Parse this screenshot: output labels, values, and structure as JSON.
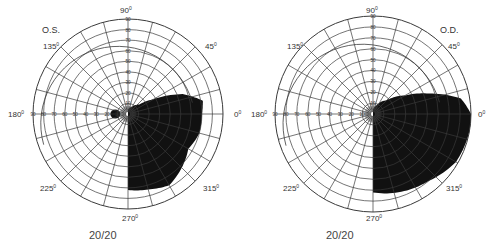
{
  "chart_data": [
    {
      "type": "polar-visual-field",
      "eye_label": "O.S.",
      "acuity": "20/20",
      "angle_labels": [
        "0°",
        "45°",
        "90°",
        "135°",
        "180°",
        "225°",
        "270°",
        "315°"
      ],
      "radial_ticks": [
        10,
        20,
        30,
        40,
        50,
        60,
        70,
        80,
        90
      ],
      "radial_unit": "degrees eccentricity",
      "meridian_step_deg": 15,
      "field_defect": {
        "description": "Dense inferior-nasal (lower right quadrant) field loss, upper boundary wavy, tapering toward 270°",
        "boundary_points_deg": [
          {
            "angle": 0,
            "ecc": 70
          },
          {
            "angle": 10,
            "ecc": 72
          },
          {
            "angle": 20,
            "ecc": 55
          },
          {
            "angle": 30,
            "ecc": 28
          },
          {
            "angle": 40,
            "ecc": 14
          },
          {
            "angle": 60,
            "ecc": 8
          },
          {
            "angle": 90,
            "ecc": 4
          },
          {
            "angle": 270,
            "ecc": 72
          },
          {
            "angle": 285,
            "ecc": 74
          },
          {
            "angle": 300,
            "ecc": 78
          },
          {
            "angle": 315,
            "ecc": 72
          },
          {
            "angle": 330,
            "ecc": 66
          },
          {
            "angle": 345,
            "ecc": 70
          }
        ],
        "small_scotoma": {
          "angle": 180,
          "ecc": 12
        }
      },
      "isopter_outer_deg": 60
    },
    {
      "type": "polar-visual-field",
      "eye_label": "O.D.",
      "acuity": "20/20",
      "angle_labels": [
        "0°",
        "45°",
        "90°",
        "135°",
        "180°",
        "225°",
        "270°",
        "315°"
      ],
      "radial_ticks": [
        10,
        20,
        30,
        40,
        50,
        60,
        70,
        80,
        90
      ],
      "radial_unit": "degrees eccentricity",
      "meridian_step_deg": 15,
      "field_defect": {
        "description": "Dense inferior-temporal/nasal lower-right quadrant field loss extending nearly to 90° periphery",
        "boundary_points_deg": [
          {
            "angle": 0,
            "ecc": 90
          },
          {
            "angle": 10,
            "ecc": 82
          },
          {
            "angle": 20,
            "ecc": 55
          },
          {
            "angle": 30,
            "ecc": 34
          },
          {
            "angle": 45,
            "ecc": 18
          },
          {
            "angle": 70,
            "ecc": 8
          },
          {
            "angle": 90,
            "ecc": 4
          },
          {
            "angle": 270,
            "ecc": 72
          },
          {
            "angle": 290,
            "ecc": 76
          },
          {
            "angle": 310,
            "ecc": 80
          },
          {
            "angle": 330,
            "ecc": 88
          },
          {
            "angle": 350,
            "ecc": 90
          }
        ]
      },
      "isopter_outer_deg": 60
    }
  ],
  "charts": {
    "left": {
      "eye": "O.S.",
      "acuity": "20/20"
    },
    "right": {
      "eye": "O.D.",
      "acuity": "20/20"
    }
  },
  "labels": {
    "a0": "0",
    "a45": "45",
    "a90": "90",
    "a135": "135",
    "a180": "180",
    "a225": "225",
    "a270": "270",
    "a315": "315",
    "deg": "0"
  },
  "colors": {
    "grid": "#3a3a3a",
    "defect": "#111111",
    "text": "#333333",
    "background": "#ffffff"
  }
}
